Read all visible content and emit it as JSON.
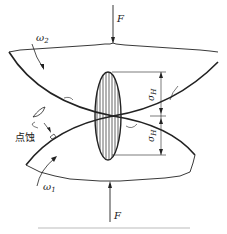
{
  "diagram": {
    "labels": {
      "force_top": "F",
      "force_bottom": "F",
      "omega_upper": "ω",
      "omega_upper_sub": "2",
      "omega_lower": "ω",
      "omega_lower_sub": "1",
      "stress_upper": "σ",
      "stress_upper_sub": "H",
      "stress_lower": "σ",
      "stress_lower_sub": "H",
      "pitting": "点蚀"
    },
    "colors": {
      "line": "#222222",
      "background": "#ffffff",
      "footer_line": "#dddddd"
    }
  }
}
